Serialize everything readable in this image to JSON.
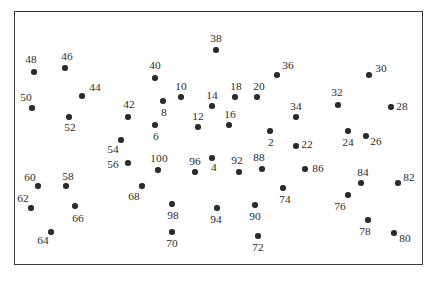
{
  "figure": {
    "width": 438,
    "height": 292,
    "background_color": "#ffffff",
    "frame": {
      "x": 14,
      "y": 11,
      "width": 409,
      "height": 254,
      "border_color": "#3a3a3a",
      "border_width": 1.4
    },
    "dot_color": "#2b2b2b",
    "label_color": "#2b2b2b",
    "dot_radius": 2.7
  },
  "chart_data": {
    "type": "scatter",
    "title": "",
    "xlabel": "",
    "ylabel": "",
    "grid": false,
    "legend": "none",
    "axis_ticks": "none",
    "xlim": [
      14,
      423
    ],
    "ylim": [
      11,
      265
    ],
    "point_count": 50,
    "labels": [
      "2",
      "4",
      "6",
      "8",
      "10",
      "12",
      "14",
      "16",
      "18",
      "20",
      "22",
      "24",
      "26",
      "28",
      "30",
      "32",
      "34",
      "36",
      "38",
      "40",
      "42",
      "44",
      "46",
      "48",
      "50",
      "52",
      "54",
      "56",
      "58",
      "60",
      "62",
      "64",
      "66",
      "68",
      "70",
      "72",
      "74",
      "76",
      "78",
      "80",
      "82",
      "84",
      "86",
      "88",
      "90",
      "92",
      "94",
      "96",
      "98",
      "100"
    ],
    "points": [
      {
        "label": "48",
        "x": 34,
        "y": 72,
        "lx": 31,
        "ly": 60
      },
      {
        "label": "46",
        "x": 65,
        "y": 68,
        "lx": 67,
        "ly": 57
      },
      {
        "label": "50",
        "x": 32,
        "y": 108,
        "lx": 26,
        "ly": 98
      },
      {
        "label": "44",
        "x": 82,
        "y": 96,
        "lx": 95,
        "ly": 88
      },
      {
        "label": "52",
        "x": 69,
        "y": 117,
        "lx": 70,
        "ly": 128
      },
      {
        "label": "42",
        "x": 128,
        "y": 117,
        "lx": 129,
        "ly": 105
      },
      {
        "label": "40",
        "x": 155,
        "y": 78,
        "lx": 155,
        "ly": 66
      },
      {
        "label": "8",
        "x": 163,
        "y": 101,
        "lx": 164,
        "ly": 113
      },
      {
        "label": "6",
        "x": 155,
        "y": 125,
        "lx": 156,
        "ly": 137
      },
      {
        "label": "10",
        "x": 181,
        "y": 97,
        "lx": 181,
        "ly": 87
      },
      {
        "label": "12",
        "x": 198,
        "y": 127,
        "lx": 198,
        "ly": 117
      },
      {
        "label": "14",
        "x": 212,
        "y": 106,
        "lx": 212,
        "ly": 96
      },
      {
        "label": "16",
        "x": 229,
        "y": 125,
        "lx": 230,
        "ly": 115
      },
      {
        "label": "18",
        "x": 235,
        "y": 97,
        "lx": 236,
        "ly": 87
      },
      {
        "label": "20",
        "x": 257,
        "y": 97,
        "lx": 259,
        "ly": 87
      },
      {
        "label": "38",
        "x": 216,
        "y": 50,
        "lx": 216,
        "ly": 39
      },
      {
        "label": "36",
        "x": 277,
        "y": 75,
        "lx": 288,
        "ly": 66
      },
      {
        "label": "34",
        "x": 296,
        "y": 117,
        "lx": 296,
        "ly": 107
      },
      {
        "label": "30",
        "x": 369,
        "y": 75,
        "lx": 381,
        "ly": 69
      },
      {
        "label": "32",
        "x": 338,
        "y": 105,
        "lx": 337,
        "ly": 93
      },
      {
        "label": "28",
        "x": 391,
        "y": 107,
        "lx": 402,
        "ly": 107
      },
      {
        "label": "26",
        "x": 366,
        "y": 136,
        "lx": 376,
        "ly": 142
      },
      {
        "label": "24",
        "x": 348,
        "y": 131,
        "lx": 348,
        "ly": 143
      },
      {
        "label": "2",
        "x": 270,
        "y": 131,
        "lx": 271,
        "ly": 143
      },
      {
        "label": "22",
        "x": 296,
        "y": 146,
        "lx": 307,
        "ly": 145
      },
      {
        "label": "86",
        "x": 305,
        "y": 169,
        "lx": 318,
        "ly": 169
      },
      {
        "label": "88",
        "x": 262,
        "y": 169,
        "lx": 259,
        "ly": 158
      },
      {
        "label": "92",
        "x": 239,
        "y": 172,
        "lx": 237,
        "ly": 161
      },
      {
        "label": "4",
        "x": 212,
        "y": 158,
        "lx": 214,
        "ly": 168
      },
      {
        "label": "96",
        "x": 195,
        "y": 172,
        "lx": 195,
        "ly": 162
      },
      {
        "label": "100",
        "x": 158,
        "y": 170,
        "lx": 159,
        "ly": 159
      },
      {
        "label": "54",
        "x": 121,
        "y": 140,
        "lx": 113,
        "ly": 150
      },
      {
        "label": "56",
        "x": 128,
        "y": 163,
        "lx": 113,
        "ly": 165
      },
      {
        "label": "68",
        "x": 142,
        "y": 186,
        "lx": 134,
        "ly": 197
      },
      {
        "label": "60",
        "x": 38,
        "y": 186,
        "lx": 30,
        "ly": 178
      },
      {
        "label": "58",
        "x": 66,
        "y": 186,
        "lx": 68,
        "ly": 177
      },
      {
        "label": "62",
        "x": 31,
        "y": 208,
        "lx": 23,
        "ly": 199
      },
      {
        "label": "66",
        "x": 75,
        "y": 206,
        "lx": 78,
        "ly": 219
      },
      {
        "label": "64",
        "x": 51,
        "y": 232,
        "lx": 43,
        "ly": 241
      },
      {
        "label": "98",
        "x": 172,
        "y": 204,
        "lx": 173,
        "ly": 216
      },
      {
        "label": "70",
        "x": 172,
        "y": 232,
        "lx": 172,
        "ly": 244
      },
      {
        "label": "94",
        "x": 217,
        "y": 208,
        "lx": 216,
        "ly": 220
      },
      {
        "label": "90",
        "x": 255,
        "y": 205,
        "lx": 255,
        "ly": 217
      },
      {
        "label": "72",
        "x": 258,
        "y": 236,
        "lx": 258,
        "ly": 248
      },
      {
        "label": "74",
        "x": 283,
        "y": 188,
        "lx": 285,
        "ly": 200
      },
      {
        "label": "76",
        "x": 348,
        "y": 195,
        "lx": 340,
        "ly": 207
      },
      {
        "label": "84",
        "x": 361,
        "y": 183,
        "lx": 363,
        "ly": 173
      },
      {
        "label": "78",
        "x": 368,
        "y": 220,
        "lx": 365,
        "ly": 232
      },
      {
        "label": "82",
        "x": 398,
        "y": 183,
        "lx": 409,
        "ly": 178
      },
      {
        "label": "80",
        "x": 394,
        "y": 233,
        "lx": 405,
        "ly": 239
      }
    ]
  }
}
